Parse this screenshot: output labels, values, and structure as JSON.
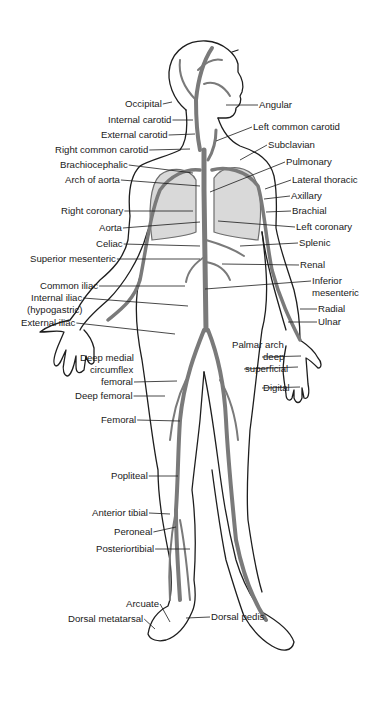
{
  "figure": {
    "colors": {
      "outline": "#1e1e1e",
      "vessel": "#7a7a7a",
      "label": "#1a1a1a",
      "background": "#ffffff"
    }
  },
  "labels_left": [
    {
      "id": "occipital",
      "text": "Occipital",
      "x": 125,
      "y": 98,
      "tx": 172,
      "ty": 102
    },
    {
      "id": "internal-carotid",
      "text": "Internal carotid",
      "x": 108,
      "y": 114,
      "tx": 193,
      "ty": 120
    },
    {
      "id": "external-carotid",
      "text": "External carotid",
      "x": 101,
      "y": 129,
      "tx": 195,
      "ty": 134
    },
    {
      "id": "right-common-carotid",
      "text": "Right common carotid",
      "x": 55,
      "y": 144,
      "tx": 190,
      "ty": 149
    },
    {
      "id": "brachiocephalic",
      "text": "Brachiocephalic",
      "x": 60,
      "y": 159,
      "tx": 193,
      "ty": 173
    },
    {
      "id": "arch-of-aorta",
      "text": "Arch of aorta",
      "x": 65,
      "y": 174,
      "tx": 200,
      "ty": 186
    },
    {
      "id": "right-coronary",
      "text": "Right coronary",
      "x": 61,
      "y": 205,
      "tx": 193,
      "ty": 211
    },
    {
      "id": "aorta",
      "text": "Aorta",
      "x": 99,
      "y": 222,
      "tx": 200,
      "ty": 222
    },
    {
      "id": "celiac",
      "text": "Celiac",
      "x": 96,
      "y": 238,
      "tx": 200,
      "ty": 246
    },
    {
      "id": "superior-mesenteric",
      "text": "Superior mesenteric",
      "x": 30,
      "y": 253,
      "tx": 200,
      "ty": 259
    },
    {
      "id": "common-iliac",
      "text": "Common iliac",
      "x": 40,
      "y": 280,
      "tx": 185,
      "ty": 286
    },
    {
      "id": "internal-iliac",
      "text": "Internal iliac",
      "x": 31,
      "y": 292,
      "tx": 188,
      "ty": 306
    },
    {
      "id": "internal-iliac-alt",
      "text": "(hypogastric)",
      "x": 27,
      "y": 304,
      "tx": null,
      "ty": null
    },
    {
      "id": "external-iliac",
      "text": "External iliac",
      "x": 21,
      "y": 317,
      "tx": 175,
      "ty": 334
    },
    {
      "id": "deep-medial-circumflex",
      "text": "Deep medial",
      "x": 80,
      "y": 352,
      "tx": null,
      "ty": null
    },
    {
      "id": "deep-medial-circumflex-2",
      "text": "circumflex",
      "x": 90,
      "y": 364,
      "tx": null,
      "ty": null
    },
    {
      "id": "deep-medial-circumflex-3",
      "text": "femoral",
      "x": 101,
      "y": 376,
      "tx": 177,
      "ty": 381
    },
    {
      "id": "deep-femoral",
      "text": "Deep femoral",
      "x": 75,
      "y": 390,
      "tx": 165,
      "ty": 396
    },
    {
      "id": "femoral",
      "text": "Femoral",
      "x": 101,
      "y": 414,
      "tx": 180,
      "ty": 421
    },
    {
      "id": "popliteal",
      "text": "Popliteal",
      "x": 111,
      "y": 470,
      "tx": 178,
      "ty": 476
    },
    {
      "id": "anterior-tibial",
      "text": "Anterior tibial",
      "x": 92,
      "y": 507,
      "tx": 170,
      "ty": 514
    },
    {
      "id": "peroneal",
      "text": "Peroneal",
      "x": 114,
      "y": 526,
      "tx": 176,
      "ty": 527
    },
    {
      "id": "posterior-tibial",
      "text": "Posteriortibial",
      "x": 96,
      "y": 543,
      "tx": 190,
      "ty": 549
    },
    {
      "id": "arcuate",
      "text": "Arcuate",
      "x": 126,
      "y": 598,
      "tx": 170,
      "ty": 622
    },
    {
      "id": "dorsal-metatarsal",
      "text": "Dorsal metatarsal",
      "x": 68,
      "y": 613,
      "tx": 155,
      "ty": 629
    }
  ],
  "labels_right": [
    {
      "id": "angular",
      "text": "Angular",
      "x": 259,
      "y": 99,
      "tx": 226,
      "ty": 105
    },
    {
      "id": "left-common-carotid",
      "text": "Left common carotid",
      "x": 253,
      "y": 121,
      "tx": 216,
      "ty": 141
    },
    {
      "id": "subclavian",
      "text": "Subclavian",
      "x": 268,
      "y": 139,
      "tx": 240,
      "ty": 160
    },
    {
      "id": "pulmonary",
      "text": "Pulmonary",
      "x": 286,
      "y": 156,
      "tx": 210,
      "ty": 192
    },
    {
      "id": "lateral-thoracic",
      "text": "Lateral thoracic",
      "x": 292,
      "y": 174,
      "tx": 265,
      "ty": 189
    },
    {
      "id": "axillary",
      "text": "Axillary",
      "x": 291,
      "y": 190,
      "tx": 264,
      "ty": 199
    },
    {
      "id": "brachial",
      "text": "Brachial",
      "x": 292,
      "y": 205,
      "tx": 266,
      "ty": 212
    },
    {
      "id": "left-coronary",
      "text": "Left coronary",
      "x": 296,
      "y": 221,
      "tx": 218,
      "ty": 221
    },
    {
      "id": "splenic",
      "text": "Splenic",
      "x": 299,
      "y": 237,
      "tx": 240,
      "ty": 246
    },
    {
      "id": "renal",
      "text": "Renal",
      "x": 300,
      "y": 259,
      "tx": 222,
      "ty": 264
    },
    {
      "id": "inferior-mesenteric",
      "text": "Inferior",
      "x": 312,
      "y": 275,
      "tx": 205,
      "ty": 289
    },
    {
      "id": "inferior-mesenteric-2",
      "text": "mesenteric",
      "x": 312,
      "y": 287,
      "tx": null,
      "ty": null
    },
    {
      "id": "radial",
      "text": "Radial",
      "x": 318,
      "y": 303,
      "tx": 300,
      "ty": 309
    },
    {
      "id": "ulnar",
      "text": "Ulnar",
      "x": 318,
      "y": 316,
      "tx": 288,
      "ty": 322
    },
    {
      "id": "palmar-arch",
      "text": "Palmar arch",
      "x": 232,
      "y": 339,
      "tx": null,
      "ty": null
    },
    {
      "id": "palmar-arch-deep",
      "text": "deep",
      "x": 263,
      "y": 351,
      "tx": 301,
      "ty": 356
    },
    {
      "id": "palmar-arch-superficial",
      "text": "superficial",
      "x": 245,
      "y": 363,
      "tx": 298,
      "ty": 367
    },
    {
      "id": "digital",
      "text": "Digital",
      "x": 263,
      "y": 382,
      "tx": 300,
      "ty": 387
    },
    {
      "id": "dorsal-pedis",
      "text": "Dorsal pedis",
      "x": 211,
      "y": 611,
      "tx": 186,
      "ty": 618
    }
  ]
}
